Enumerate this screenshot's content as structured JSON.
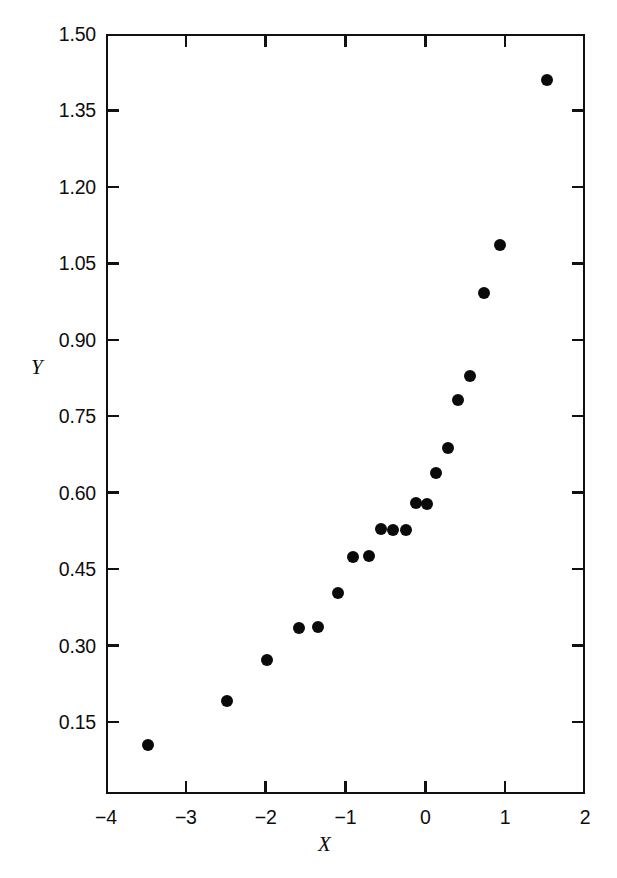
{
  "chart_data": {
    "type": "scatter",
    "title": "",
    "xlabel": "X",
    "ylabel": "Y",
    "xlim": [
      -4,
      2
    ],
    "ylim": [
      0.0,
      1.5
    ],
    "grid": false,
    "legend": null,
    "x_ticks": [
      "-4",
      "-3",
      "-2",
      "-1",
      "0",
      "1",
      "2"
    ],
    "x_tick_values": [
      -4,
      -3,
      -2,
      -1,
      0,
      1,
      2
    ],
    "y_ticks": [
      "0.15",
      "0.30",
      "0.45",
      "0.60",
      "0.75",
      "0.90",
      "1.05",
      "1.20",
      "1.35",
      "1.50"
    ],
    "y_tick_values": [
      0.15,
      0.3,
      0.45,
      0.6,
      0.75,
      0.9,
      1.05,
      1.2,
      1.35,
      1.5
    ],
    "marker": "filled-circle",
    "marker_color": "#0a0a0a",
    "points": [
      {
        "x": -3.47,
        "y": 0.105
      },
      {
        "x": -2.48,
        "y": 0.192
      },
      {
        "x": -1.98,
        "y": 0.272
      },
      {
        "x": -1.58,
        "y": 0.335
      },
      {
        "x": -1.35,
        "y": 0.337
      },
      {
        "x": -1.1,
        "y": 0.404
      },
      {
        "x": -0.91,
        "y": 0.474
      },
      {
        "x": -0.71,
        "y": 0.476
      },
      {
        "x": -0.55,
        "y": 0.529
      },
      {
        "x": -0.4,
        "y": 0.527
      },
      {
        "x": -0.24,
        "y": 0.527
      },
      {
        "x": -0.12,
        "y": 0.58
      },
      {
        "x": 0.02,
        "y": 0.578
      },
      {
        "x": 0.13,
        "y": 0.639
      },
      {
        "x": 0.29,
        "y": 0.688
      },
      {
        "x": 0.41,
        "y": 0.782
      },
      {
        "x": 0.56,
        "y": 0.829
      },
      {
        "x": 0.73,
        "y": 0.992
      },
      {
        "x": 0.94,
        "y": 1.085
      },
      {
        "x": 1.52,
        "y": 1.41
      }
    ]
  },
  "axes": {
    "x_title": "X",
    "y_title": "Y"
  },
  "colors": {
    "axis": "#111111",
    "marker": "#0a0a0a",
    "background": "#ffffff"
  }
}
